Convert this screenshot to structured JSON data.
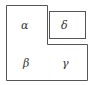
{
  "diagram": {
    "regions": [
      {
        "id": "alpha",
        "label": "α"
      },
      {
        "id": "beta",
        "label": "β"
      },
      {
        "id": "gamma",
        "label": "γ"
      },
      {
        "id": "delta",
        "label": "δ"
      }
    ],
    "colors": {
      "stroke": "#555555",
      "background": "#ffffff",
      "text": "#333333"
    }
  }
}
